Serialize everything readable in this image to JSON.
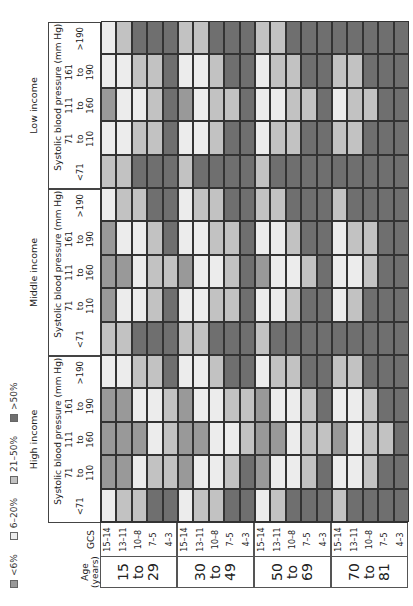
{
  "legend": [
    {
      "label": "<6%",
      "key": "M",
      "color": "#999999"
    },
    {
      "label": "6–20%",
      "key": "W",
      "color": "#ececec"
    },
    {
      "label": "21–50%",
      "key": "L",
      "color": "#c2c2c2"
    },
    {
      "label": ">50%",
      "key": "D",
      "color": "#6f6f6f"
    }
  ],
  "row_headers": {
    "age": "Age (years)",
    "gcs": "GCS"
  },
  "bp_title": "Systolic blood pressure (mm Hg)",
  "income_groups": [
    "High income",
    "Middle income",
    "Low income"
  ],
  "bp_labels": [
    "<71",
    "71 to 110",
    "111 to 160",
    "161 to 190",
    ">190"
  ],
  "age_groups": [
    {
      "lines": [
        "15",
        "to",
        "29"
      ]
    },
    {
      "lines": [
        "30",
        "to",
        "49"
      ]
    },
    {
      "lines": [
        "50",
        "to",
        "69"
      ]
    },
    {
      "lines": [
        "70",
        "to",
        "81"
      ]
    }
  ],
  "gcs_labels": [
    "15–14",
    "13–11",
    "10–8",
    "7–5",
    "4–3"
  ],
  "chart_data": {
    "type": "heatmap",
    "title": "",
    "orientation": "rotated -90deg",
    "legend": [
      "<6%",
      "6–20%",
      "21–50%",
      ">50%"
    ],
    "legend_keys": {
      "M": "<6%",
      "W": "6–20%",
      "L": "21–50%",
      "D": ">50%"
    },
    "row_dimension": "Age (years) × GCS",
    "rows": [
      "15–29 / 15–14",
      "15–29 / 13–11",
      "15–29 / 10–8",
      "15–29 / 7–5",
      "15–29 / 4–3",
      "30–49 / 15–14",
      "30–49 / 13–11",
      "30–49 / 10–8",
      "30–49 / 7–5",
      "30–49 / 4–3",
      "50–69 / 15–14",
      "50–69 / 13–11",
      "50–69 / 10–8",
      "50–69 / 7–5",
      "50–69 / 4–3",
      "70–81 / 15–14",
      "70–81 / 13–11",
      "70–81 / 10–8",
      "70–81 / 7–5",
      "70–81 / 4–3"
    ],
    "column_dimension": "Income × Systolic blood pressure (mm Hg)",
    "columns": [
      "High / <71",
      "High / 71–110",
      "High / 111–160",
      "High / 161–190",
      "High / >190",
      "Middle / <71",
      "Middle / 71–110",
      "Middle / 111–160",
      "Middle / 161–190",
      "Middle / >190",
      "Low / <71",
      "Low / 71–110",
      "Low / 111–160",
      "Low / 161–190",
      "Low / >190"
    ],
    "values_by_column": {
      "High / <71": "WLLDDWLLDDWLDDDLDDDD",
      "High / 71–110": "MMWLLMWWLDMWWLDWWLDD",
      "High / 111–160": "MMMWLMMWWLMMWLLMWLLD",
      "High / 161–190": "MMWWLMWWLLMWWLDWWLDD",
      "High / >190": "WWLLDWWLDDWLLDDLLDDD",
      "Middle / <71": "LLDDDLLDDDLDDDDDDDDD",
      "Middle / 71–110": "MWWLDWWLLDWWLDDWLDDD",
      "Middle / 111–160": "MMWLLMWWLDMWWLDWWLDD",
      "Middle / 161–190": "MWWLDWWLLDWWLDDWLLDD",
      "Middle / >190": "WLLDDWLLDDLLDDDLDDDD",
      "Low / <71": "LLDDDLDDDDLDDDDDDDDD",
      "Low / 71–110": "WWLLDWWLDDWLLDDLLDDD",
      "Low / 111–160": "MWWLDMWLLDWWLLDWLLDD",
      "Low / 161–190": "WWLLDWWLDDWLLDDLLDDD",
      "Low / >190": "WLDDDLLDDDLLDDDDDDDD"
    }
  }
}
